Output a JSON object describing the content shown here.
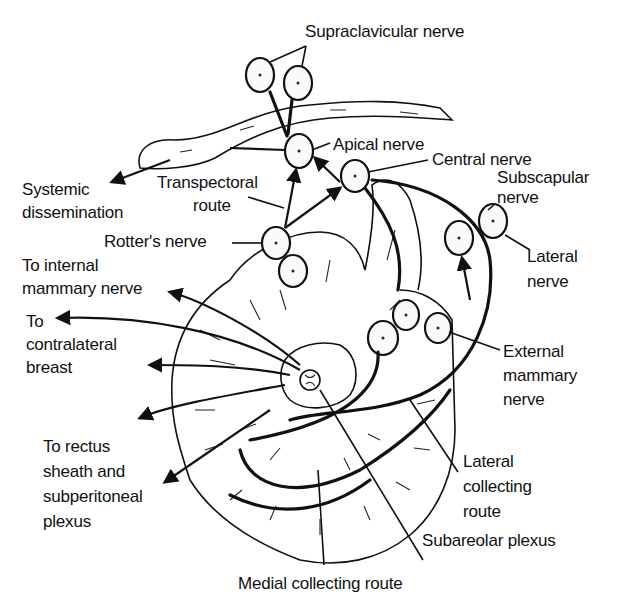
{
  "figure": {
    "labels": {
      "supraclavicular": "Supraclavicular nerve",
      "apical": "Apical nerve",
      "central": "Central nerve",
      "subscapular_1": "Subscapular",
      "subscapular_2": "nerve",
      "systemic_1": "Systemic",
      "systemic_2": "dissemination",
      "transpectoral_1": "Transpectoral",
      "transpectoral_2": "route",
      "rotters": "Rotter's nerve",
      "lateral_nerve_1": "Lateral",
      "lateral_nerve_2": "nerve",
      "internal_mammary_1": "To internal",
      "internal_mammary_2": "mammary nerve",
      "contralateral_1": "To",
      "contralateral_2": "contralateral",
      "contralateral_3": "breast",
      "external_mammary_1": "External",
      "external_mammary_2": "mammary",
      "external_mammary_3": "nerve",
      "rectus_1": "To rectus",
      "rectus_2": "sheath and",
      "rectus_3": "subperitoneal",
      "rectus_4": "plexus",
      "lateral_collecting_1": "Lateral",
      "lateral_collecting_2": "collecting",
      "lateral_collecting_3": "route",
      "subareolar": "Subareolar plexus",
      "medial_collecting": "Medial collecting route"
    },
    "colors": {
      "ink": "#111111",
      "background": "#ffffff"
    }
  }
}
